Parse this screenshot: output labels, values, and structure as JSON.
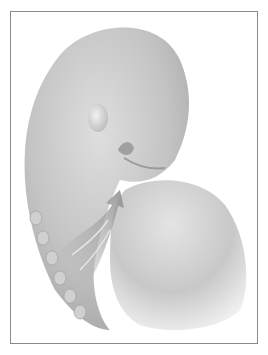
{
  "illustration": {
    "subject": "embryo",
    "frame_color": "#8a8a8a",
    "background": "#ffffff",
    "body_tone": "#bdbdbd",
    "arrow_tone": "#9a9a9a"
  }
}
